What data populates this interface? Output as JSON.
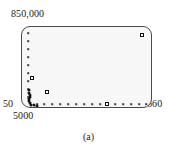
{
  "figure": {
    "caption": "(a)"
  },
  "axes": {
    "y_max_label": "850,000",
    "y_min_label": "50",
    "x_min_label": "5000",
    "x_max_label": "660"
  },
  "colors": {
    "frame": "#4a4a4a",
    "plot_background": "#f7f7f7",
    "marker": "#111111",
    "text": "#1c1c1c",
    "page_background": "#ffffff"
  },
  "chart_data": {
    "type": "scatter",
    "title": "",
    "xlabel": "",
    "ylabel": "",
    "xlim": [
      5000,
      660
    ],
    "ylim": [
      50,
      850000
    ],
    "grid": false,
    "legend": null,
    "axis_tick_labels": {
      "y": [
        "850,000",
        "50"
      ],
      "x": [
        "5000",
        "660"
      ]
    },
    "series": [
      {
        "name": "small-markers",
        "marker": "dot",
        "points": [
          {
            "px": 6,
            "py": 6
          },
          {
            "px": 6,
            "py": 14
          },
          {
            "px": 6,
            "py": 22
          },
          {
            "px": 6,
            "py": 30
          },
          {
            "px": 6,
            "py": 38
          },
          {
            "px": 6,
            "py": 46
          },
          {
            "px": 6,
            "py": 54
          },
          {
            "px": 6,
            "py": 62
          },
          {
            "px": 6,
            "py": 70
          },
          {
            "px": 15,
            "py": 77
          },
          {
            "px": 22,
            "py": 77
          },
          {
            "px": 30,
            "py": 77
          },
          {
            "px": 38,
            "py": 77
          },
          {
            "px": 46,
            "py": 77
          },
          {
            "px": 54,
            "py": 77
          },
          {
            "px": 62,
            "py": 77
          },
          {
            "px": 70,
            "py": 77
          },
          {
            "px": 78,
            "py": 77
          },
          {
            "px": 93,
            "py": 77
          },
          {
            "px": 101,
            "py": 77
          },
          {
            "px": 109,
            "py": 77
          },
          {
            "px": 117,
            "py": 77
          },
          {
            "px": 124,
            "py": 77
          }
        ]
      },
      {
        "name": "square-markers",
        "marker": "square",
        "points": [
          {
            "px": 120,
            "py": 8
          },
          {
            "px": 10,
            "py": 51
          },
          {
            "px": 25,
            "py": 65
          },
          {
            "px": 85,
            "py": 77
          }
        ]
      },
      {
        "name": "dense-cluster",
        "marker": "blob",
        "points": [
          {
            "px": 7,
            "py": 63
          },
          {
            "px": 7,
            "py": 66
          },
          {
            "px": 8,
            "py": 68
          },
          {
            "px": 8,
            "py": 70
          },
          {
            "px": 7,
            "py": 72
          },
          {
            "px": 7,
            "py": 74
          },
          {
            "px": 8,
            "py": 76
          },
          {
            "px": 9,
            "py": 78
          },
          {
            "px": 12,
            "py": 78
          },
          {
            "px": 15,
            "py": 79
          }
        ]
      }
    ]
  }
}
